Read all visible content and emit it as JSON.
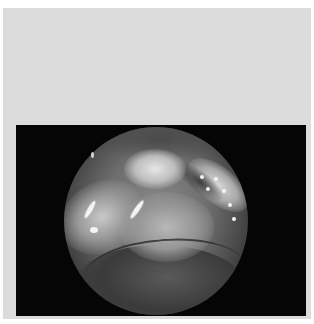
{
  "image": {
    "description": "Grayscale endoscopic view within a circular aperture on a black field, framed by a light gray panel",
    "colors": {
      "page_background": "#ffffff",
      "panel": "#dcdcdc",
      "frame": "#050505"
    }
  }
}
